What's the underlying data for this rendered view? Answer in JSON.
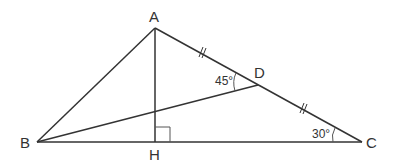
{
  "diagram": {
    "points": {
      "A": {
        "label": "A",
        "x": 155,
        "y": 28
      },
      "B": {
        "label": "B",
        "x": 37,
        "y": 142
      },
      "C": {
        "label": "C",
        "x": 362,
        "y": 142
      },
      "D": {
        "label": "D",
        "x": 258,
        "y": 85
      },
      "H": {
        "label": "H",
        "x": 155,
        "y": 142
      }
    },
    "segments": [
      "AB",
      "AC",
      "BC",
      "AH",
      "BD"
    ],
    "equal_marks": [
      "AD",
      "DC"
    ],
    "right_angle": "AHB at H",
    "angles": {
      "ADB": "45°",
      "ACB": "30°"
    },
    "colors": {
      "line": "#333333",
      "background": "#ffffff"
    }
  }
}
